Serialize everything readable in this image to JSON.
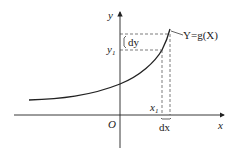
{
  "diagram": {
    "axes": {
      "x_label": "x",
      "y_label": "y",
      "origin_label": "O"
    },
    "curve_label": "Y=g(X)",
    "point_labels": {
      "x1": "x",
      "x1_sub": "1",
      "y1": "y",
      "y1_sub": "1"
    },
    "differentials": {
      "dx": "dx",
      "dy": "dy"
    },
    "colors": {
      "line": "#222222",
      "dash": "#444444"
    }
  }
}
